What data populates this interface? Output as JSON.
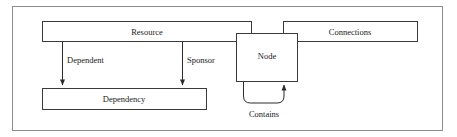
{
  "diagram": {
    "type": "entity-relationship-diagram",
    "frame": {
      "stroke": "#8c8c8c",
      "x": 12,
      "y": 6,
      "width": 431,
      "height": 125
    },
    "style": {
      "box_stroke": "#3a3a3a",
      "box_fill": "#ffffff",
      "edge_stroke": "#2b2b2b",
      "text_color": "#1a1a1a"
    },
    "entities": [
      {
        "id": "resource",
        "label": "Resource",
        "x": 42,
        "y": 21,
        "width": 210,
        "height": 21,
        "label_x": 147,
        "label_y": 32
      },
      {
        "id": "connections",
        "label": "Connections",
        "x": 283,
        "y": 21,
        "width": 135,
        "height": 21,
        "label_x": 350,
        "label_y": 32
      },
      {
        "id": "node",
        "label": "Node",
        "x": 236,
        "y": 33,
        "width": 62,
        "height": 49,
        "label_x": 267,
        "label_y": 55
      },
      {
        "id": "dependency",
        "label": "Dependency",
        "x": 42,
        "y": 88,
        "width": 165,
        "height": 22,
        "label_x": 124,
        "label_y": 99
      }
    ],
    "relationships": [
      {
        "id": "dependent",
        "label": "Dependent",
        "from": "resource",
        "to": "dependency",
        "label_x": 66,
        "label_y": 60,
        "line": {
          "x1": 62,
          "y1": 42,
          "x2": 62,
          "y2": 86
        }
      },
      {
        "id": "sponsor",
        "label": "Sponsor",
        "from": "resource",
        "to": "dependency",
        "label_x": 186,
        "label_y": 60,
        "line": {
          "x1": 182,
          "y1": 42,
          "x2": 182,
          "y2": 86
        }
      },
      {
        "id": "contains",
        "label": "Contains",
        "from": "node",
        "to": "node",
        "self_loop": true,
        "label_x": 264,
        "label_y": 113,
        "path": "M 243 82 L 243 96 Q 243 103 250 103 L 277 103 Q 284 103 284 96 L 284 85"
      }
    ]
  }
}
